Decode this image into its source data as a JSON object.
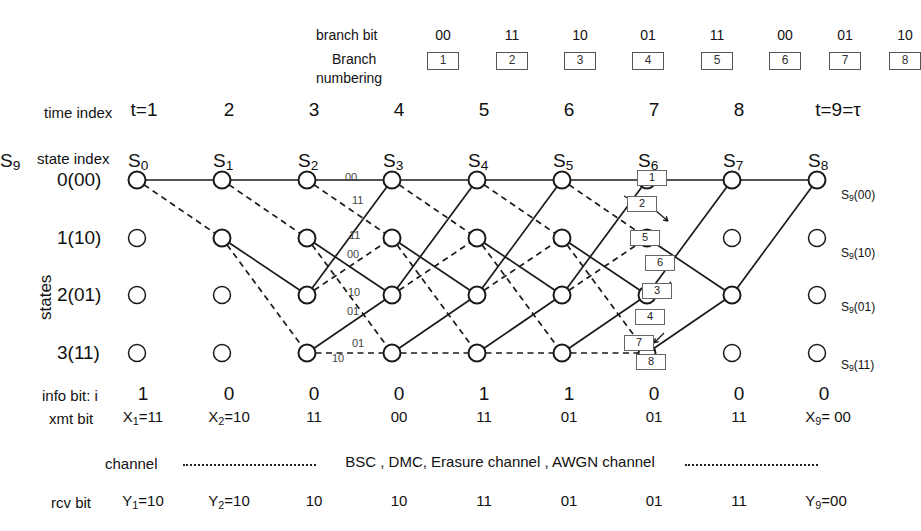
{
  "header": {
    "branch_bit_label": "branch bit",
    "branch_numbering_label_line1": "Branch",
    "branch_numbering_label_line2": "numbering",
    "branch_bits": [
      "00",
      "11",
      "10",
      "01",
      "11",
      "00",
      "01",
      "10"
    ],
    "branch_numbers": [
      "1",
      "2",
      "3",
      "4",
      "5",
      "6",
      "7",
      "8"
    ]
  },
  "time_index": {
    "label": "time index",
    "values": [
      "t=1",
      "2",
      "3",
      "4",
      "5",
      "6",
      "7",
      "8",
      "t=9=τ"
    ]
  },
  "state_index": {
    "label": "state index",
    "rows": [
      "0(00)",
      "1(10)",
      "2(01)",
      "3(11)"
    ],
    "axis_label": "states"
  },
  "trellis": {
    "node_labels": [
      "S0",
      "S1",
      "S2",
      "S3",
      "S4",
      "S5",
      "S6",
      "S7",
      "S8",
      "S9"
    ],
    "node_label_text": [
      "S",
      "S",
      "S",
      "S",
      "S",
      "S",
      "S",
      "S",
      "S",
      "S"
    ],
    "node_subscripts": [
      "0",
      "1",
      "2",
      "3",
      "4",
      "5",
      "6",
      "7",
      "8",
      "9"
    ],
    "final_state_labels": [
      "S9(00)",
      "S9(10)",
      "S9(01)",
      "S9(11)"
    ],
    "stage3_branch_bits": {
      "state0_upper": "00",
      "state0_lower": "11",
      "state1_upper": "11",
      "state1_lower": "00",
      "state2_upper": "10",
      "state2_lower": "01",
      "state3_upper": "01",
      "state3_lower": "10"
    },
    "callout_boxes": [
      "1",
      "2",
      "5",
      "6",
      "3",
      "4",
      "7",
      "8"
    ],
    "solid_meaning": "input 0",
    "dashed_meaning": "input 1"
  },
  "info_bit": {
    "label": "info bit: i",
    "values": [
      "1",
      "0",
      "0",
      "0",
      "1",
      "1",
      "0",
      "0",
      "0"
    ]
  },
  "xmt_bit": {
    "label": "xmt bit",
    "values": [
      "X1=11",
      "X2=10",
      "11",
      "00",
      "11",
      "01",
      "01",
      "11",
      "X9= 00"
    ]
  },
  "channel": {
    "label": "channel",
    "text": "BSC , DMC,  Erasure channel , AWGN channel"
  },
  "rcv_bit": {
    "label": "rcv bit",
    "values": [
      "Y1=10",
      "Y2=10",
      "10",
      "10",
      "11",
      "01",
      "01",
      "11",
      "Y9=00"
    ]
  },
  "colors": {
    "line": "#1a1a1a",
    "text": "#111111",
    "box_border": "#555555",
    "background": "#ffffff"
  }
}
